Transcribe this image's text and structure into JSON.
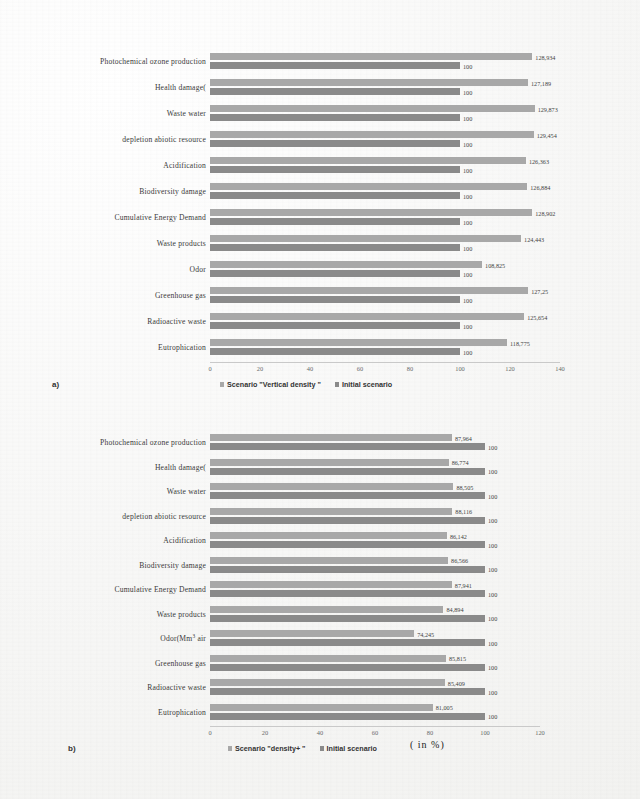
{
  "figure": {
    "unit_note": "( in %)",
    "panel_a_tag": "a)",
    "panel_b_tag": "b)"
  },
  "chart_data": [
    {
      "type": "bar",
      "orientation": "horizontal",
      "panel": "a)",
      "title": "",
      "xlabel": "",
      "ylabel": "",
      "xlim": [
        0,
        140
      ],
      "xticks": [
        0,
        20,
        40,
        60,
        80,
        100,
        120,
        140
      ],
      "grid": false,
      "legend_position": "bottom",
      "categories": [
        "Photochemical ozone production",
        "Health damage(",
        "Waste water",
        "depletion abiotic resource",
        "Acidification",
        "Biodiversity damage",
        "Cumulative Energy Demand",
        "Waste products",
        "Odor",
        "Greenhouse gas",
        "Radioactive waste",
        "Eutrophication"
      ],
      "series": [
        {
          "name": "Scenario \"Vertical density \"",
          "color": "#a8a8a8",
          "values": [
            128.934,
            127.189,
            129.873,
            129.454,
            126.363,
            126.884,
            128.902,
            124.443,
            108.825,
            127.25,
            125.654,
            118.775
          ],
          "labels": [
            "128,934",
            "127,189",
            "129,873",
            "129,454",
            "126,363",
            "126,884",
            "128,902",
            "124,443",
            "108,825",
            "127,25",
            "125,654",
            "118,775"
          ]
        },
        {
          "name": "Initial scenario",
          "color": "#8a8a8a",
          "values": [
            100,
            100,
            100,
            100,
            100,
            100,
            100,
            100,
            100,
            100,
            100,
            100
          ],
          "labels": [
            "100",
            "100",
            "100",
            "100",
            "100",
            "100",
            "100",
            "100",
            "100",
            "100",
            "100",
            "100"
          ]
        }
      ]
    },
    {
      "type": "bar",
      "orientation": "horizontal",
      "panel": "b)",
      "title": "",
      "xlabel": "",
      "ylabel": "",
      "xlim": [
        0,
        120
      ],
      "xticks": [
        0,
        20,
        40,
        60,
        80,
        100,
        120
      ],
      "grid": false,
      "legend_position": "bottom",
      "categories": [
        "Photochemical ozone production",
        "Health damage(",
        "Waste water",
        "depletion abiotic resource",
        "Acidification",
        "Biodiversity damage",
        "Cumulative Energy Demand",
        "Waste products",
        "Odor(Mm3 air",
        "Greenhouse gas",
        "Radioactive waste",
        "Eutrophication"
      ],
      "series": [
        {
          "name": "Scenario \"density+ \"",
          "color": "#a8a8a8",
          "values": [
            87.964,
            86.774,
            88.505,
            88.116,
            86.142,
            86.566,
            87.941,
            84.894,
            74.245,
            85.815,
            85.409,
            81.005
          ],
          "labels": [
            "87,964",
            "86,774",
            "88,505",
            "88,116",
            "86,142",
            "86,566",
            "87,941",
            "84,894",
            "74,245",
            "85,815",
            "85,409",
            "81,005"
          ]
        },
        {
          "name": "Initial scenario",
          "color": "#8a8a8a",
          "values": [
            100,
            100,
            100,
            100,
            100,
            100,
            100,
            100,
            100,
            100,
            100,
            100
          ],
          "labels": [
            "100",
            "100",
            "100",
            "100",
            "100",
            "100",
            "100",
            "100",
            "100",
            "100",
            "100",
            "100"
          ]
        }
      ]
    }
  ]
}
